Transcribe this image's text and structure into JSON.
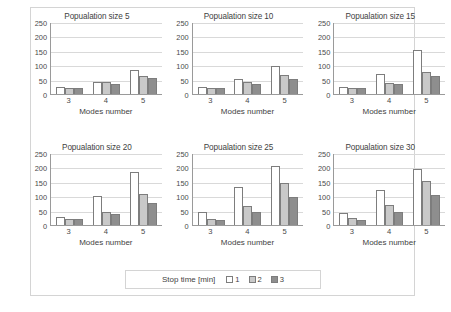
{
  "chart_data": {
    "type": "bar",
    "title": "",
    "xlabel": "Modes number",
    "ylabel": "",
    "ylim": [
      0,
      250
    ],
    "yticks": [
      0,
      50,
      100,
      150,
      200,
      250
    ],
    "categories": [
      "3",
      "4",
      "5"
    ],
    "grid": true,
    "legend": {
      "title": "Stop time [min]",
      "position": "bottom",
      "entries": [
        {
          "name": "1",
          "color": "#ffffff"
        },
        {
          "name": "2",
          "color": "#c9c9c9"
        },
        {
          "name": "3",
          "color": "#8e8e8e"
        }
      ]
    },
    "panels": [
      {
        "title": "Popualation size 5",
        "categories": [
          "3",
          "4",
          "5"
        ],
        "series": [
          {
            "name": "1",
            "values": [
              23,
              43,
              83
            ]
          },
          {
            "name": "2",
            "values": [
              22,
              40,
              61
            ]
          },
          {
            "name": "3",
            "values": [
              21,
              35,
              54
            ]
          }
        ]
      },
      {
        "title": "Popualation size 10",
        "categories": [
          "3",
          "4",
          "5"
        ],
        "series": [
          {
            "name": "1",
            "values": [
              25,
              51,
              96
            ]
          },
          {
            "name": "2",
            "values": [
              21,
              41,
              66
            ]
          },
          {
            "name": "3",
            "values": [
              22,
              36,
              51
            ]
          }
        ]
      },
      {
        "title": "Popualation size 15",
        "categories": [
          "3",
          "4",
          "5"
        ],
        "series": [
          {
            "name": "1",
            "values": [
              26,
              68,
              152
            ]
          },
          {
            "name": "2",
            "values": [
              22,
              38,
              77
            ]
          },
          {
            "name": "3",
            "values": [
              20,
              35,
              62
            ]
          }
        ]
      },
      {
        "title": "Popualation size 20",
        "categories": [
          "3",
          "4",
          "5"
        ],
        "series": [
          {
            "name": "1",
            "values": [
              29,
              102,
              183
            ]
          },
          {
            "name": "2",
            "values": [
              22,
              46,
              108
            ]
          },
          {
            "name": "3",
            "values": [
              20,
              39,
              78
            ]
          }
        ]
      },
      {
        "title": "Popualation size 25",
        "categories": [
          "3",
          "4",
          "5"
        ],
        "series": [
          {
            "name": "1",
            "values": [
              46,
              131,
              205
            ]
          },
          {
            "name": "2",
            "values": [
              21,
              65,
              145
            ]
          },
          {
            "name": "3",
            "values": [
              19,
              45,
              96
            ]
          }
        ]
      },
      {
        "title": "Popualation size 30",
        "categories": [
          "3",
          "4",
          "5"
        ],
        "series": [
          {
            "name": "1",
            "values": [
              42,
              120,
              194
            ]
          },
          {
            "name": "2",
            "values": [
              24,
              71,
              152
            ]
          },
          {
            "name": "3",
            "values": [
              19,
              46,
              103
            ]
          }
        ]
      }
    ]
  }
}
